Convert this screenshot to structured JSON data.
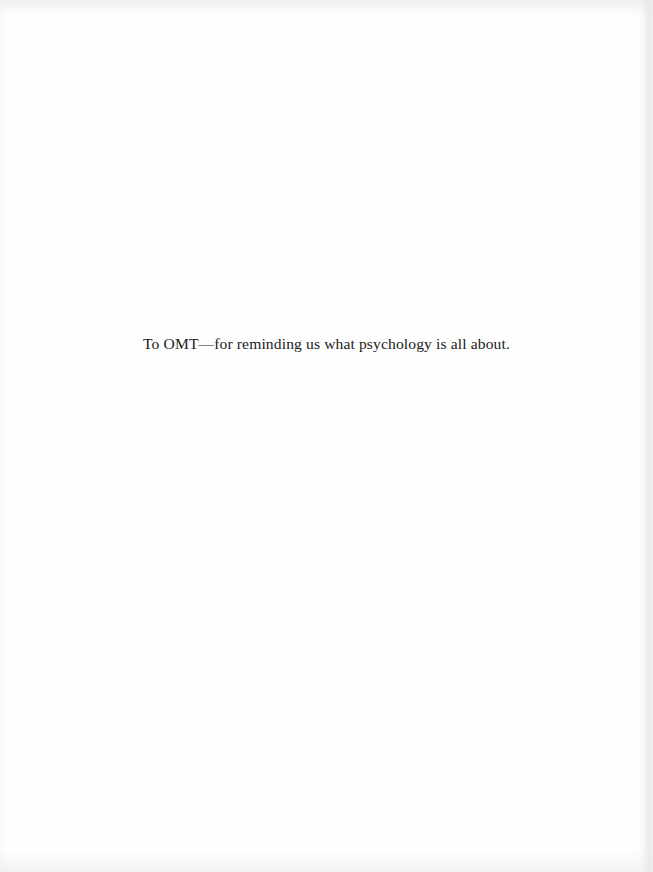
{
  "page": {
    "kind": "book-dedication-page",
    "background_color": "#fefefe",
    "ink_color": "#1b1b1d",
    "width": 653,
    "height": 872
  },
  "dedication": {
    "text": "To OMT—for reminding us what psychology is all about."
  }
}
